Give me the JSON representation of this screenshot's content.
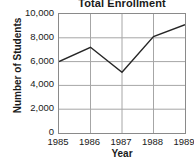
{
  "chart_data": {
    "type": "line",
    "title": "Total Enrollment",
    "xlabel": "Year",
    "ylabel": "Number of Students",
    "categories": [
      "1985",
      "1986",
      "1987",
      "1988",
      "1989"
    ],
    "values": [
      6000,
      7200,
      5100,
      8100,
      9100
    ],
    "series": [
      {
        "name": "Total Enrollment",
        "values": [
          6000,
          7200,
          5100,
          8100,
          9100
        ]
      }
    ],
    "x": [
      1985,
      1986,
      1987,
      1988,
      1989
    ],
    "ylim": [
      0,
      10000
    ],
    "xlim": [
      1985,
      1989
    ],
    "ytick_labels": [
      "0",
      "2,000",
      "4,000",
      "6,000",
      "8,000",
      "10,000"
    ],
    "ytick_values": [
      0,
      2000,
      4000,
      6000,
      8000,
      10000
    ],
    "xtick_labels": [
      "1985",
      "1986",
      "1987",
      "1988",
      "1989"
    ],
    "grid": true,
    "legend": false,
    "legend_position": "none",
    "line_color": "#262626",
    "grid_color": "#a6a6a6",
    "frame_color": "#8a8a8a",
    "background_color": "#ffffff"
  }
}
